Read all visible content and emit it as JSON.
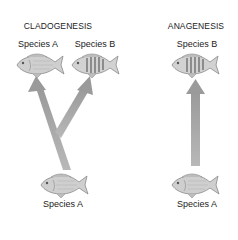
{
  "cladogenesis": {
    "title": "CLADOGENESIS",
    "top_left_label": "Species A",
    "top_right_label": "Species B",
    "bottom_label": "Species A"
  },
  "anagenesis": {
    "title": "ANAGENESIS",
    "top_label": "Species B",
    "bottom_label": "Species A"
  },
  "colors": {
    "arrow": "#a9a9a9",
    "fish_body": "#c8c8c8",
    "fish_outline": "#8a8a8a",
    "text": "#222222"
  }
}
